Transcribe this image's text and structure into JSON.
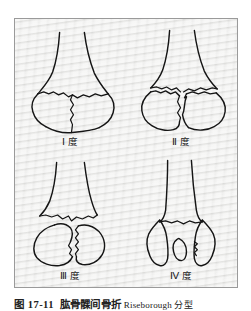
{
  "figure": {
    "background_color": "#e9e9e7",
    "border_color": "#9a9a9a",
    "line_color": "#151515",
    "caption": {
      "number": "图 17-11",
      "title": "肱骨髁间骨折",
      "tail": "Riseborough 分型",
      "full": "图 17-11  肱骨髁间骨折 Riseborough 分型"
    },
    "panels": [
      {
        "id": "grade-1",
        "label": "Ⅰ 度",
        "roman": "Ⅰ",
        "unit": "度",
        "description": "无分离的髁间骨折"
      },
      {
        "id": "grade-2",
        "label": "Ⅱ 度",
        "roman": "Ⅱ",
        "unit": "度",
        "description": "髁间骨折有分离但无旋转"
      },
      {
        "id": "grade-3",
        "label": "Ⅲ 度",
        "roman": "Ⅲ",
        "unit": "度",
        "description": "髁间骨折有分离并有旋转移位"
      },
      {
        "id": "grade-4",
        "label": "Ⅳ 度",
        "roman": "Ⅳ",
        "unit": "度",
        "description": "严重粉碎性髁间骨折"
      }
    ]
  }
}
